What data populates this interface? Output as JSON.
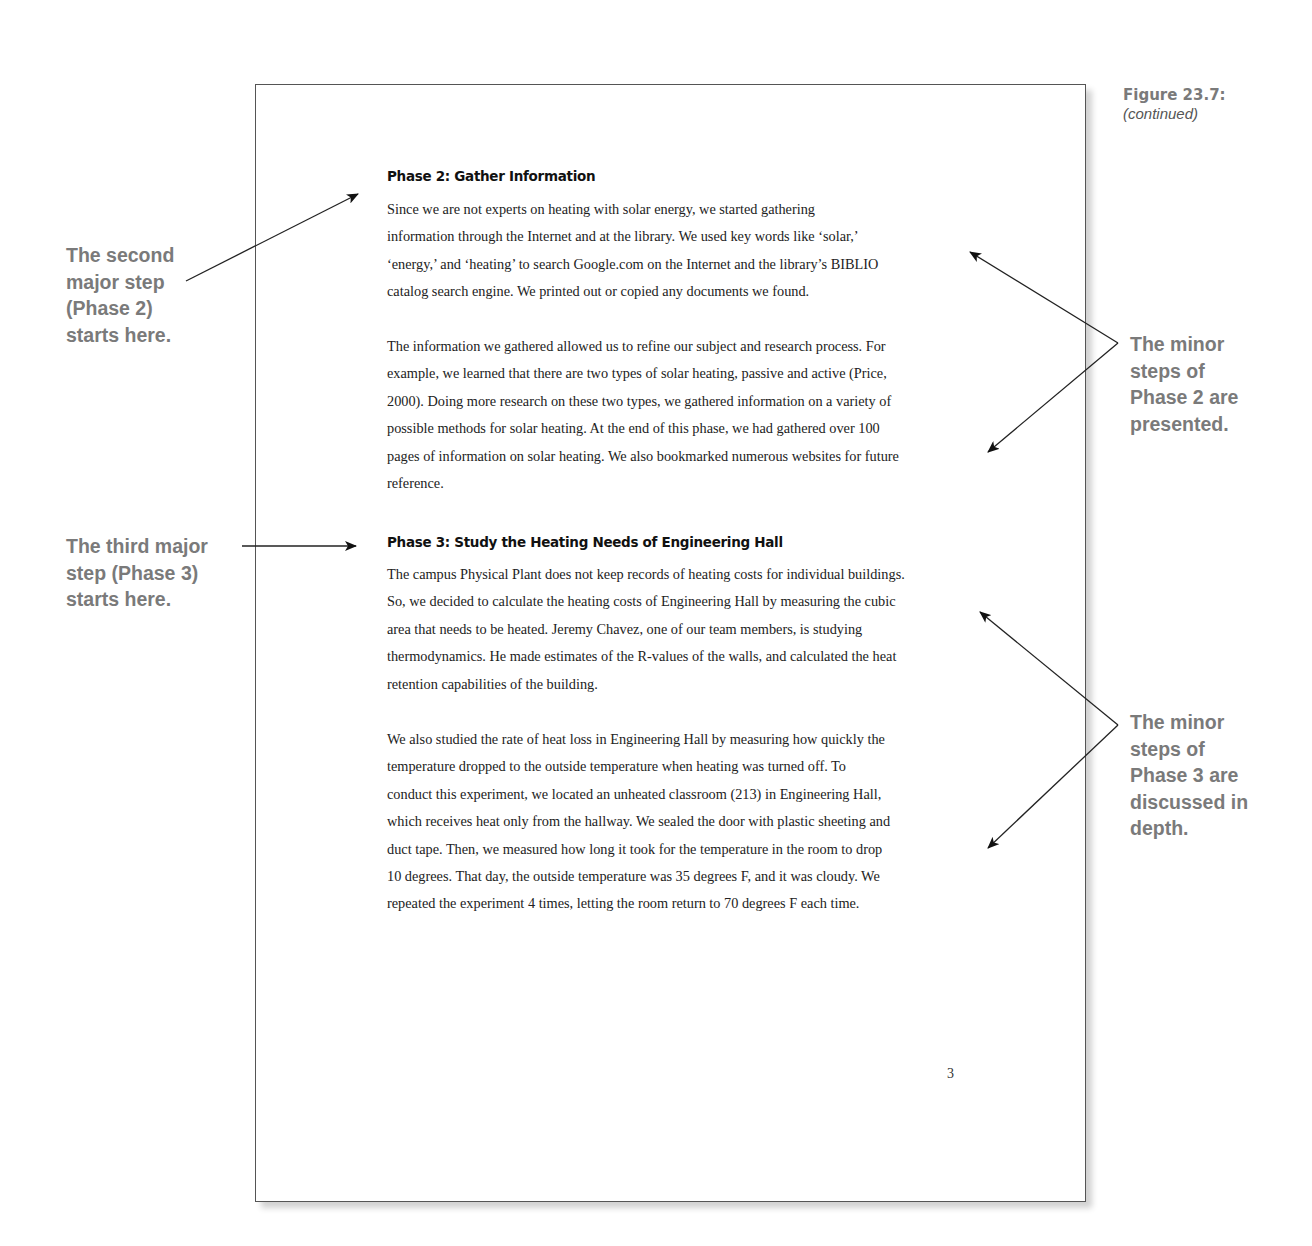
{
  "figure": {
    "title": "Figure 23.7:",
    "subtitle": "(continued)"
  },
  "document": {
    "page_number": "3",
    "sections": [
      {
        "heading": "Phase 2: Gather Information",
        "paragraphs": [
          {
            "lines": [
              "Since we are not experts on heating with solar energy, we started gathering",
              "information through the Internet and at the library. We used key words like ‘solar,’",
              "‘energy,’ and ‘heating’ to search Google.com on the Internet and the library’s BIBLIO",
              "catalog search engine. We printed out or copied any documents we found."
            ]
          },
          {
            "lines": [
              "The information we gathered allowed us to refine our subject and research process. For",
              "example, we learned that there are two types of solar heating, passive and active (Price,",
              "2000). Doing more research on these two types, we gathered information on a variety of",
              "possible methods for solar heating. At the end of this phase, we had gathered over 100",
              "pages of information on solar heating. We also bookmarked numerous websites for future",
              "reference."
            ]
          }
        ]
      },
      {
        "heading": "Phase 3: Study the Heating Needs of Engineering Hall",
        "paragraphs": [
          {
            "lines": [
              "The campus Physical Plant does not keep records of heating costs for individual buildings.",
              "So, we decided to calculate the heating costs of Engineering Hall by measuring the cubic",
              "area that needs to be heated. Jeremy Chavez, one of our team members, is studying",
              "thermodynamics. He made estimates of the R-values of the walls, and calculated the heat",
              "retention capabilities of the building."
            ]
          },
          {
            "lines": [
              "We also studied the rate of heat loss in Engineering Hall by measuring how quickly the",
              "temperature dropped to the outside temperature when heating was turned off.  To",
              "conduct this experiment, we located an unheated classroom (213) in Engineering Hall,",
              "which receives heat only from the hallway. We sealed the door with plastic sheeting and",
              "duct tape. Then, we measured how long it took for the temperature in the room to drop",
              "10 degrees. That day, the outside temperature was 35 degrees F, and it was cloudy. We",
              "repeated the experiment 4 times, letting the room return to 70 degrees F each time."
            ]
          }
        ]
      }
    ]
  },
  "callouts": {
    "left": [
      {
        "lines": [
          "The second",
          "major step",
          "(Phase 2)",
          "starts here."
        ]
      },
      {
        "lines": [
          "The third major",
          "step (Phase 3)",
          "starts here."
        ]
      }
    ],
    "right": [
      {
        "lines": [
          "The minor",
          "steps of",
          "Phase 2 are",
          "presented."
        ]
      },
      {
        "lines": [
          "The minor",
          "steps of",
          "Phase 3 are",
          "discussed in",
          "depth."
        ]
      }
    ]
  },
  "colors": {
    "callout_text": "#7a7a7a",
    "page_border": "#555555",
    "body_text": "#222222"
  }
}
